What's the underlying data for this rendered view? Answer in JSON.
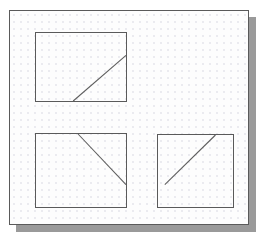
{
  "document": {
    "title": "Dot-grid worksheet with three boxed diagonal segments",
    "paper_color": "#fdfdfd",
    "border_color": "#5a5a5a",
    "shadow_color": "#9a9a9a",
    "dot_color": "#c9c9d6",
    "line_color": "#5e5e5e",
    "grid": {
      "dot_spacing_px": 7,
      "dot_radius_px": 0.65,
      "origin_x_px": 4,
      "origin_y_px": 4
    }
  },
  "figures": [
    {
      "id": "figure-top-left",
      "label": "Top-left box with diagonal rising to the right",
      "x": 25,
      "y": 21,
      "width": 92,
      "height": 70,
      "segment": {
        "x1": 38,
        "y1": 70,
        "x2": 92,
        "y2": 23,
        "direction": "up-right",
        "touches": [
          "bottom-edge",
          "right-edge"
        ]
      }
    },
    {
      "id": "figure-bottom-left",
      "label": "Bottom-left box with diagonal falling to the right",
      "x": 25,
      "y": 122,
      "width": 92,
      "height": 75,
      "segment": {
        "x1": 43,
        "y1": 0,
        "x2": 92,
        "y2": 52,
        "direction": "down-right",
        "touches": [
          "top-edge",
          "right-edge"
        ]
      }
    },
    {
      "id": "figure-bottom-right",
      "label": "Bottom-right box with diagonal rising to the right",
      "x": 147,
      "y": 123,
      "width": 77,
      "height": 74,
      "segment": {
        "x1": 7,
        "y1": 51,
        "x2": 59,
        "y2": 0,
        "direction": "up-right",
        "touches": [
          "left-area",
          "top-edge"
        ]
      }
    }
  ]
}
